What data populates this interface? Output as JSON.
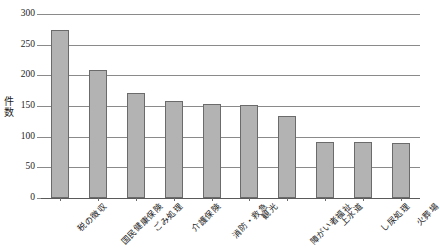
{
  "chart_data": {
    "type": "bar",
    "title": "",
    "xlabel": "",
    "ylabel": "件数",
    "ylim": [
      0,
      300
    ],
    "ytick_step": 50,
    "yticks": [
      "300",
      "250",
      "200",
      "150",
      "100",
      "50",
      "0"
    ],
    "grid": true,
    "legend": "none",
    "categories": [
      "税の徴収",
      "国民健康保険",
      "ごみ処理",
      "介護保険",
      "消防・救急",
      "観光",
      "障がい者福祉",
      "上水道",
      "し尿処理",
      "火葬場"
    ],
    "values": [
      274,
      209,
      171,
      158,
      154,
      152,
      134,
      92,
      91,
      89
    ],
    "bar_color": "#b3b3b3",
    "bar_edge_color": "#6b6b6b",
    "grid_color": "#8a8a8a",
    "background": "#ffffff"
  }
}
